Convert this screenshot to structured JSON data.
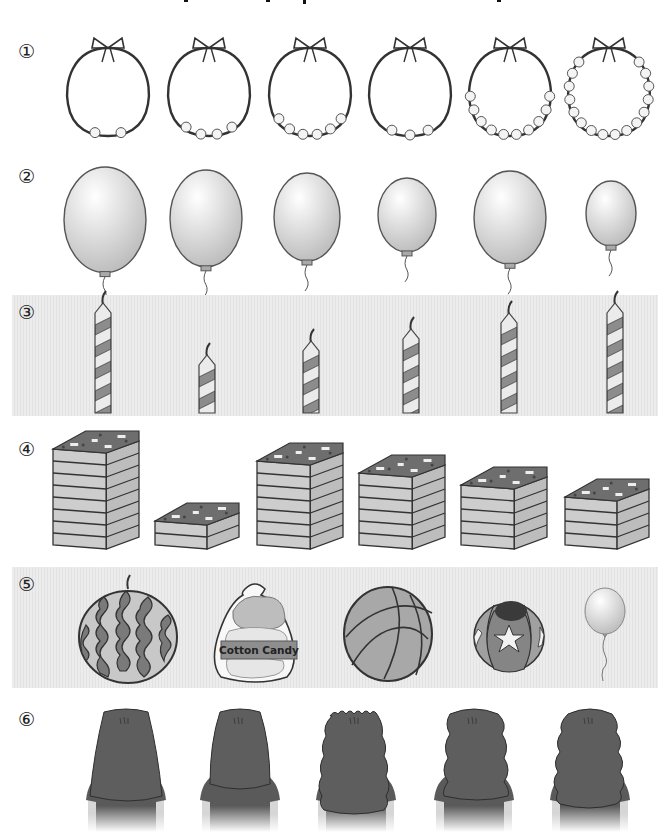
{
  "page": {
    "title_visible": "",
    "colors": {
      "stroke": "#333333",
      "band_bg": "#e8e8e8",
      "balloon_fill": "#dcdcdc",
      "candle_dark": "#8a8a8a",
      "candle_light": "#e4e4e4",
      "cake_top": "#6e6e6e",
      "cake_layer": "#c9c9c9",
      "hair": "#5c5c5c",
      "skin": "#d8d8d8"
    }
  },
  "rows": [
    {
      "number": "①",
      "subject": "necklaces",
      "items": [
        {
          "label": "necklace-1",
          "pearls": 2
        },
        {
          "label": "necklace-2",
          "pearls": 4
        },
        {
          "label": "necklace-3",
          "pearls": 6
        },
        {
          "label": "necklace-4",
          "pearls": 3
        },
        {
          "label": "necklace-5",
          "pearls": 10
        },
        {
          "label": "necklace-6",
          "pearls": 16
        }
      ]
    },
    {
      "number": "②",
      "subject": "balloons",
      "items": [
        {
          "label": "balloon-1",
          "size": "largest"
        },
        {
          "label": "balloon-2",
          "size": "large"
        },
        {
          "label": "balloon-3",
          "size": "medium"
        },
        {
          "label": "balloon-4",
          "size": "small"
        },
        {
          "label": "balloon-5",
          "size": "large"
        },
        {
          "label": "balloon-6",
          "size": "smallest"
        }
      ]
    },
    {
      "number": "③",
      "subject": "candles",
      "items": [
        {
          "label": "candle-1",
          "height": "tallest"
        },
        {
          "label": "candle-2",
          "height": "shortest"
        },
        {
          "label": "candle-3",
          "height": "short"
        },
        {
          "label": "candle-4",
          "height": "medium"
        },
        {
          "label": "candle-5",
          "height": "tall"
        },
        {
          "label": "candle-6",
          "height": "tallest"
        }
      ]
    },
    {
      "number": "④",
      "subject": "layered cakes",
      "items": [
        {
          "label": "cake-1",
          "layers": 8
        },
        {
          "label": "cake-2",
          "layers": 2
        },
        {
          "label": "cake-3",
          "layers": 7
        },
        {
          "label": "cake-4",
          "layers": 6
        },
        {
          "label": "cake-5",
          "layers": 5
        },
        {
          "label": "cake-6",
          "layers": 4
        }
      ]
    },
    {
      "number": "⑤",
      "subject": "round objects",
      "items": [
        {
          "label": "watermelon"
        },
        {
          "label": "cotton-candy",
          "text": "Cotton Candy"
        },
        {
          "label": "basketball"
        },
        {
          "label": "star-ball"
        },
        {
          "label": "balloon"
        }
      ]
    },
    {
      "number": "⑥",
      "subject": "hair styles",
      "items": [
        {
          "label": "straight-long-hair"
        },
        {
          "label": "straight-medium-hair"
        },
        {
          "label": "tight-curly-hair"
        },
        {
          "label": "wavy-hair"
        },
        {
          "label": "curly-hair"
        }
      ]
    }
  ]
}
